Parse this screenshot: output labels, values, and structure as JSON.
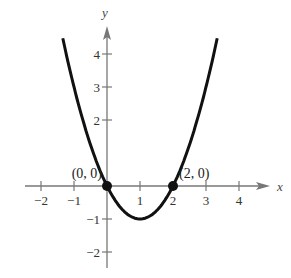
{
  "chart_data": {
    "type": "line",
    "title": "",
    "xlabel": "x",
    "ylabel": "y",
    "function": "y = x^2 - 2x",
    "xlim": [
      -2.5,
      4.8
    ],
    "ylim": [
      -2.4,
      4.7
    ],
    "x_ticks": [
      -2,
      -1,
      1,
      2,
      3,
      4
    ],
    "y_ticks": [
      -2,
      -1,
      2,
      3,
      4
    ],
    "x_tick_labels": [
      "−2",
      "−1",
      "1",
      "2",
      "3",
      "4"
    ],
    "y_tick_labels": [
      "−2",
      "−1",
      "2",
      "3",
      "4"
    ],
    "grid": false,
    "series": [
      {
        "name": "parabola",
        "x": [
          -0.7,
          -0.5,
          0,
          0.5,
          1,
          1.5,
          2,
          2.5,
          2.7
        ],
        "y": [
          1.89,
          1.25,
          0,
          -0.75,
          -1,
          -0.75,
          0,
          1.25,
          1.89
        ],
        "color": "#111111"
      }
    ],
    "points": [
      {
        "x": 0,
        "y": 0,
        "label": "(0, 0)"
      },
      {
        "x": 2,
        "y": 0,
        "label": "(2, 0)"
      }
    ],
    "vertex": {
      "x": 1,
      "y": -1
    }
  },
  "layout": {
    "origin_px": [
      107,
      186
    ],
    "unit_px": 33,
    "curve_color": "#111111",
    "axis_color": "#777777"
  }
}
